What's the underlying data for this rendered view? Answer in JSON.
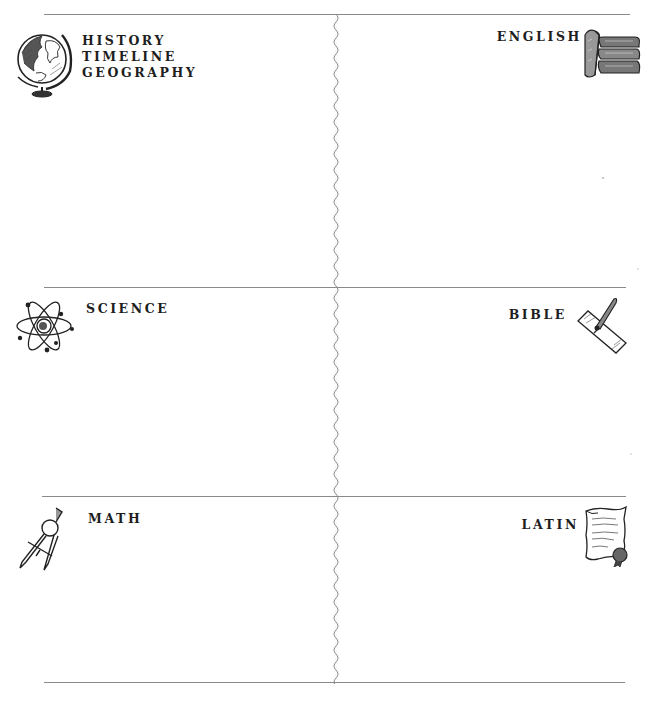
{
  "page": {
    "layout": "2-column, 3-row grid with wavy center divider"
  },
  "sections": [
    {
      "id": "history",
      "position": "top-left",
      "lines": [
        "HISTORY",
        "TIMELINE",
        "GEOGRAPHY"
      ],
      "icon": "globe-icon"
    },
    {
      "id": "english",
      "position": "top-right",
      "lines": [
        "ENGLISH"
      ],
      "icon": "books-stack-icon"
    },
    {
      "id": "science",
      "position": "middle-left",
      "lines": [
        "SCIENCE"
      ],
      "icon": "atom-icon"
    },
    {
      "id": "bible",
      "position": "middle-right",
      "lines": [
        "BIBLE"
      ],
      "icon": "quill-paper-icon"
    },
    {
      "id": "math",
      "position": "bottom-left",
      "lines": [
        "MATH"
      ],
      "icon": "compass-icon"
    },
    {
      "id": "latin",
      "position": "bottom-right",
      "lines": [
        "LATIN"
      ],
      "icon": "scroll-seal-icon"
    }
  ],
  "colors": {
    "rule": "#8a8a8a",
    "text": "#1e1e1e",
    "background": "#ffffff"
  }
}
